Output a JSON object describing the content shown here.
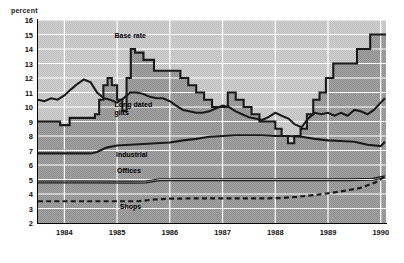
{
  "axis_title": "percent",
  "chart_data": {
    "type": "line",
    "title": "",
    "subtitle": "",
    "xlabel": "",
    "ylabel": "percent",
    "ylim": [
      2,
      16
    ],
    "xlim": [
      1983.5,
      1990.1
    ],
    "grid": true,
    "legend_position": "inline-annotations",
    "y_ticks": [
      16,
      15,
      14,
      13,
      12,
      11,
      10,
      9,
      8,
      7,
      6,
      5,
      4,
      3,
      2
    ],
    "x_ticks": [
      "1984",
      "1985",
      "1986",
      "1987",
      "1988",
      "1989",
      "1990"
    ],
    "series": [
      {
        "name": "Base rate",
        "style": "step",
        "color": "#1a1a1a",
        "x": [
          1983.5,
          1983.75,
          1983.92,
          1984.1,
          1984.3,
          1984.5,
          1984.58,
          1984.66,
          1984.74,
          1984.82,
          1984.9,
          1985.0,
          1985.1,
          1985.18,
          1985.26,
          1985.34,
          1985.5,
          1985.7,
          1985.9,
          1986.05,
          1986.2,
          1986.35,
          1986.5,
          1986.65,
          1986.8,
          1986.95,
          1987.1,
          1987.25,
          1987.4,
          1987.55,
          1987.7,
          1987.85,
          1988.0,
          1988.12,
          1988.24,
          1988.36,
          1988.48,
          1988.6,
          1988.72,
          1988.84,
          1988.96,
          1989.1,
          1989.3,
          1989.55,
          1989.8,
          1990.05
        ],
        "values": [
          9.0,
          9.0,
          8.75,
          9.25,
          9.25,
          9.25,
          9.5,
          10.5,
          11.5,
          12.0,
          11.5,
          10.5,
          9.75,
          12.0,
          14.0,
          13.75,
          13.25,
          12.5,
          12.5,
          12.5,
          12.0,
          11.5,
          11.0,
          10.5,
          10.0,
          10.0,
          11.0,
          10.5,
          10.0,
          9.5,
          9.0,
          9.0,
          8.5,
          8.0,
          7.5,
          8.0,
          8.5,
          9.5,
          10.5,
          11.0,
          12.0,
          13.0,
          13.0,
          14.0,
          15.0,
          15.0
        ]
      },
      {
        "name": "Long dated gilts",
        "style": "line",
        "color": "#1a1a1a",
        "x": [
          1983.5,
          1983.62,
          1983.75,
          1983.87,
          1984.0,
          1984.12,
          1984.25,
          1984.37,
          1984.5,
          1984.62,
          1984.75,
          1984.87,
          1985.0,
          1985.12,
          1985.25,
          1985.37,
          1985.5,
          1985.62,
          1985.75,
          1985.87,
          1986.0,
          1986.12,
          1986.25,
          1986.37,
          1986.5,
          1986.62,
          1986.75,
          1986.87,
          1987.0,
          1987.12,
          1987.25,
          1987.37,
          1987.5,
          1987.62,
          1987.75,
          1987.87,
          1988.0,
          1988.12,
          1988.25,
          1988.37,
          1988.5,
          1988.62,
          1988.75,
          1988.87,
          1989.0,
          1989.12,
          1989.25,
          1989.37,
          1989.5,
          1989.62,
          1989.75,
          1989.87,
          1990.0,
          1990.08
        ],
        "values": [
          10.5,
          10.4,
          10.6,
          10.5,
          10.8,
          11.2,
          11.6,
          11.9,
          11.7,
          11.0,
          10.6,
          10.5,
          10.3,
          10.6,
          11.0,
          11.0,
          10.9,
          10.7,
          10.6,
          10.6,
          10.4,
          10.1,
          9.8,
          9.7,
          9.6,
          9.6,
          9.7,
          9.9,
          10.1,
          10.0,
          9.7,
          9.5,
          9.3,
          9.2,
          9.1,
          9.3,
          9.6,
          9.4,
          9.2,
          8.8,
          8.6,
          9.2,
          9.6,
          9.5,
          9.6,
          9.4,
          9.6,
          9.4,
          9.8,
          9.7,
          9.5,
          9.8,
          10.3,
          10.6
        ]
      },
      {
        "name": "Industrial",
        "style": "line",
        "color": "#1a1a1a",
        "x": [
          1983.5,
          1984.0,
          1984.25,
          1984.5,
          1984.62,
          1984.8,
          1985.0,
          1985.25,
          1985.5,
          1985.75,
          1986.0,
          1986.25,
          1986.5,
          1986.75,
          1987.0,
          1987.25,
          1987.5,
          1987.75,
          1988.0,
          1988.25,
          1988.5,
          1988.75,
          1989.0,
          1989.25,
          1989.5,
          1989.75,
          1990.0,
          1990.08
        ],
        "values": [
          6.8,
          6.8,
          6.8,
          6.8,
          6.9,
          7.2,
          7.35,
          7.4,
          7.45,
          7.5,
          7.55,
          7.7,
          7.8,
          7.95,
          8.0,
          8.05,
          8.05,
          8.05,
          8.0,
          8.0,
          7.95,
          7.8,
          7.7,
          7.65,
          7.6,
          7.4,
          7.3,
          7.6
        ]
      },
      {
        "name": "Offices",
        "style": "line-thin",
        "color": "#1a1a1a",
        "x": [
          1983.5,
          1984.5,
          1985.3,
          1985.55,
          1985.8,
          1986.5,
          1987.5,
          1988.5,
          1989.4,
          1989.85,
          1990.08
        ],
        "values": [
          4.9,
          4.9,
          4.88,
          4.9,
          5.05,
          5.05,
          5.05,
          5.05,
          5.05,
          5.08,
          5.25
        ]
      },
      {
        "name": "Shops",
        "style": "dashed",
        "color": "#1a1a1a",
        "x": [
          1983.5,
          1984.5,
          1985.4,
          1985.7,
          1986.0,
          1986.6,
          1987.2,
          1987.8,
          1988.1,
          1988.4,
          1988.8,
          1989.2,
          1989.6,
          1989.9,
          1990.08
        ],
        "values": [
          3.5,
          3.5,
          3.5,
          3.62,
          3.68,
          3.7,
          3.7,
          3.7,
          3.72,
          3.8,
          3.95,
          4.15,
          4.4,
          4.8,
          5.2
        ]
      }
    ],
    "annotations": [
      {
        "text": "Base rate",
        "x": 1984.95,
        "y": 14.85
      },
      {
        "text": "Long dated\ngilts",
        "x": 1984.95,
        "y": 10.05
      },
      {
        "text": "Industrial",
        "x": 1984.98,
        "y": 6.6
      },
      {
        "text": "Offices",
        "x": 1985.0,
        "y": 5.55
      },
      {
        "text": "Shops",
        "x": 1985.05,
        "y": 3.05
      }
    ]
  },
  "colors": {
    "plot_background_upper": "#c8c8c8",
    "plot_background_lower": "#9a9a9a",
    "gridline": "#ffffff",
    "line": "#1a1a1a",
    "axis": "#000000"
  }
}
